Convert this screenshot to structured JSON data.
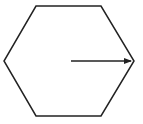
{
  "figure": {
    "shape": "regular-hexagon",
    "stroke_color": "#222222",
    "fill_color": "#ffffff",
    "hexagon_points": "36,6 101,6 134,61 101,116 36,116 4,61",
    "arrow": {
      "x1": 71,
      "y1": 61,
      "x2": 131,
      "y2": 61,
      "color": "#222222",
      "description": "arrow from center to right vertex (radius)"
    }
  }
}
